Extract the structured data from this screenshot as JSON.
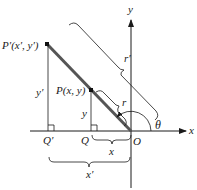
{
  "diagram": {
    "type": "coordinate-geometry",
    "points": {
      "p_prime": "P′(x′, y′)",
      "p": "P(x, y)",
      "q_prime": "Q′",
      "q": "Q",
      "origin": "O"
    },
    "axes": {
      "x": "x",
      "y": "y"
    },
    "segments": {
      "y_prime": "y′",
      "y": "y",
      "x": "x",
      "x_prime": "x′",
      "r": "r",
      "r_prime": "r′"
    },
    "angle": "θ",
    "colors": {
      "line": "#1a1a1a",
      "thick_line": "#555555"
    }
  }
}
